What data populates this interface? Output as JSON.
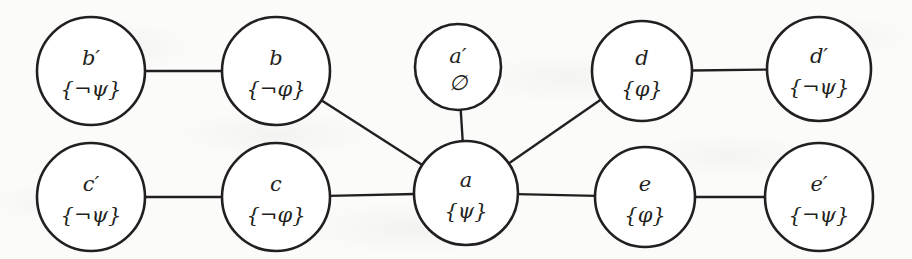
{
  "diagram": {
    "type": "undirected-graph",
    "background_color": "#fbfbfa",
    "stroke_color": "#231f20",
    "node_fill": "#ffffff",
    "width": 912,
    "height": 259,
    "nodes": [
      {
        "id": "b-prime",
        "name": "b′",
        "set": "{¬ψ}",
        "cx": 91,
        "cy": 71,
        "r": 54
      },
      {
        "id": "b",
        "name": "b",
        "set": "{¬φ}",
        "cx": 276,
        "cy": 71,
        "r": 54
      },
      {
        "id": "a-prime",
        "name": "a′",
        "set": "∅",
        "cx": 458,
        "cy": 67,
        "r": 43
      },
      {
        "id": "d",
        "name": "d",
        "set": "{φ}",
        "cx": 642,
        "cy": 71,
        "r": 50
      },
      {
        "id": "d-prime",
        "name": "d′",
        "set": "{¬ψ}",
        "cx": 819,
        "cy": 69,
        "r": 52
      },
      {
        "id": "c-prime",
        "name": "c′",
        "set": "{¬ψ}",
        "cx": 91,
        "cy": 197,
        "r": 54
      },
      {
        "id": "c",
        "name": "c",
        "set": "{¬φ}",
        "cx": 276,
        "cy": 197,
        "r": 54
      },
      {
        "id": "a",
        "name": "a",
        "set": "{ψ}",
        "cx": 466,
        "cy": 193,
        "r": 52
      },
      {
        "id": "e",
        "name": "e",
        "set": "{φ}",
        "cx": 645,
        "cy": 197,
        "r": 50
      },
      {
        "id": "e-prime",
        "name": "e′",
        "set": "{¬ψ}",
        "cx": 819,
        "cy": 197,
        "r": 54
      }
    ],
    "edges": [
      {
        "id": "edge-bprime-b",
        "from": "b-prime",
        "to": "b"
      },
      {
        "id": "edge-cprime-c",
        "from": "c-prime",
        "to": "c"
      },
      {
        "id": "edge-b-a",
        "from": "b",
        "to": "a"
      },
      {
        "id": "edge-c-a",
        "from": "c",
        "to": "a"
      },
      {
        "id": "edge-aprime-a",
        "from": "a-prime",
        "to": "a"
      },
      {
        "id": "edge-a-e",
        "from": "a",
        "to": "e"
      },
      {
        "id": "edge-a-d",
        "from": "a",
        "to": "d"
      },
      {
        "id": "edge-d-dprime",
        "from": "d",
        "to": "d-prime"
      },
      {
        "id": "edge-e-eprime",
        "from": "e",
        "to": "e-prime"
      }
    ]
  }
}
